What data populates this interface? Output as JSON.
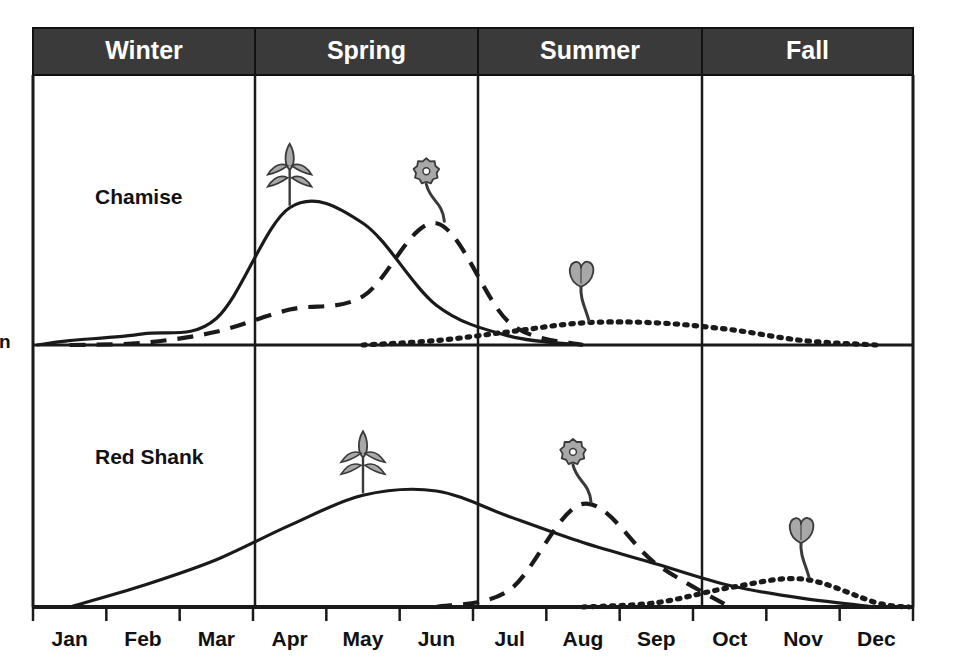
{
  "figure": {
    "background": "#ffffff",
    "header_fill": "#3a3a3a",
    "header_text_color": "#ffffff",
    "line_color": "#1a1a1a",
    "icon_fill": "#a8a8a8",
    "icon_stroke": "#3a3a3a",
    "left_edge_fragment": "n"
  },
  "seasons": [
    {
      "label": "Winter",
      "x_start": 33,
      "x_end": 255
    },
    {
      "label": "Spring",
      "x_start": 255,
      "x_end": 478
    },
    {
      "label": "Summer",
      "x_start": 478,
      "x_end": 702
    },
    {
      "label": "Fall",
      "x_start": 702,
      "x_end": 913
    }
  ],
  "months": [
    {
      "label": "Jan",
      "index": 0
    },
    {
      "label": "Feb",
      "index": 1
    },
    {
      "label": "Mar",
      "index": 2
    },
    {
      "label": "Apr",
      "index": 3
    },
    {
      "label": "May",
      "index": 4
    },
    {
      "label": "Jun",
      "index": 5
    },
    {
      "label": "Jul",
      "index": 6
    },
    {
      "label": "Aug",
      "index": 7
    },
    {
      "label": "Sep",
      "index": 8
    },
    {
      "label": "Oct",
      "index": 9
    },
    {
      "label": "Nov",
      "index": 10
    },
    {
      "label": "Dec",
      "index": 11
    }
  ],
  "panels": [
    {
      "id": "chamise",
      "label": "Chamise",
      "label_x": 95,
      "label_y": 198,
      "top": 75,
      "bottom": 345
    },
    {
      "id": "redshank",
      "label": "Red Shank",
      "label_x": 95,
      "label_y": 458,
      "top": 345,
      "bottom": 607
    }
  ],
  "chart_data": {
    "type": "line",
    "xlabel": "",
    "ylabel": "",
    "grid": false,
    "legend_position": "none",
    "x": [
      "Jan",
      "Feb",
      "Mar",
      "Apr",
      "May",
      "Jun",
      "Jul",
      "Aug",
      "Sep",
      "Oct",
      "Nov",
      "Dec"
    ],
    "x_axis": {
      "type": "category",
      "ticks": 12,
      "range": [
        "Jan",
        "Dec"
      ]
    },
    "panels": [
      {
        "name": "Chamise",
        "series": [
          {
            "name": "vegetative growth",
            "style": "solid",
            "icon": "sprout-icon",
            "icon_month": "Apr",
            "peak_month": "Apr",
            "values": [
              0.02,
              0.05,
              0.12,
              0.62,
              0.55,
              0.18,
              0.04,
              0.0,
              0.0,
              0.0,
              0.0,
              0.0
            ]
          },
          {
            "name": "flowering",
            "style": "dashed",
            "icon": "flower-icon",
            "icon_month": "Jun",
            "peak_month": "Jun",
            "values": [
              0.0,
              0.01,
              0.06,
              0.16,
              0.22,
              0.55,
              0.1,
              0.0,
              0.0,
              0.0,
              0.0,
              0.0
            ]
          },
          {
            "name": "seed dispersal",
            "style": "dotted",
            "icon": "seed-icon",
            "icon_month": "Aug",
            "peak_month": "Aug",
            "values": [
              0.0,
              0.0,
              0.0,
              0.0,
              0.0,
              0.02,
              0.06,
              0.1,
              0.1,
              0.07,
              0.02,
              0.0
            ]
          }
        ]
      },
      {
        "name": "Red Shank",
        "series": [
          {
            "name": "vegetative growth",
            "style": "solid",
            "icon": "sprout-icon",
            "icon_month": "May",
            "peak_month": "May",
            "values": [
              0.0,
              0.1,
              0.22,
              0.38,
              0.52,
              0.54,
              0.42,
              0.3,
              0.2,
              0.1,
              0.04,
              0.0
            ]
          },
          {
            "name": "flowering",
            "style": "dashed",
            "icon": "flower-icon",
            "icon_month": "Aug",
            "peak_month": "Aug",
            "values": [
              0.0,
              0.0,
              0.0,
              0.0,
              0.0,
              0.0,
              0.08,
              0.48,
              0.2,
              0.0,
              0.0,
              0.0
            ]
          },
          {
            "name": "seed dispersal",
            "style": "dotted",
            "icon": "seed-icon",
            "icon_month": "Nov",
            "peak_month": "Nov",
            "values": [
              0.0,
              0.0,
              0.0,
              0.0,
              0.0,
              0.0,
              0.0,
              0.0,
              0.02,
              0.09,
              0.13,
              0.02
            ]
          }
        ]
      }
    ]
  }
}
